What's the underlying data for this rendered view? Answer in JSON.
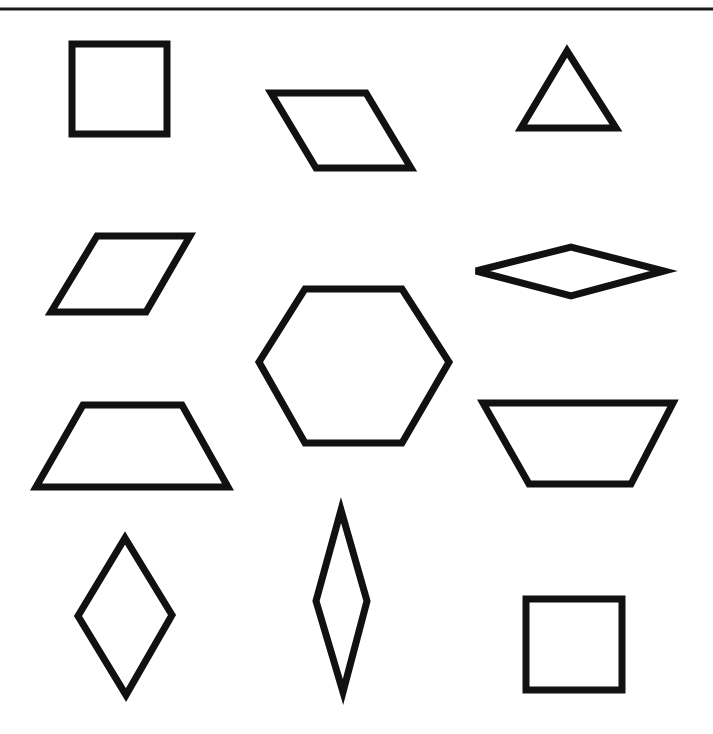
{
  "diagram": {
    "stroke_color": "#111111",
    "background": "#ffffff",
    "top_rule": {
      "x1": 0,
      "y1": 9,
      "x2": 713,
      "y2": 9
    },
    "shapes": [
      {
        "name": "square-top-left",
        "type": "square",
        "points": "72,44 167,44 167,134 72,134"
      },
      {
        "name": "rhombus-tilted-top",
        "type": "rhombus",
        "points": "271,93 366,93 411,168 316,168"
      },
      {
        "name": "triangle-top-right",
        "type": "triangle",
        "points": "567,51 616,128 521,128"
      },
      {
        "name": "rhombus-left",
        "type": "rhombus",
        "points": "97,236 190,236 146,312 51,312"
      },
      {
        "name": "thin-rhombus-horizontal",
        "type": "rhombus",
        "points": "476,271 571,247 664,271 571,296"
      },
      {
        "name": "hexagon-center",
        "type": "hexagon",
        "points": "305,289 402,289 449,362 402,443 305,443 259,362"
      },
      {
        "name": "trapezoid-left",
        "type": "trapezoid",
        "points": "83,405 182,405 228,487 36,487"
      },
      {
        "name": "trapezoid-right-inverted",
        "type": "trapezoid",
        "points": "483,403 673,403 631,484 529,484"
      },
      {
        "name": "rhombus-vertical-left",
        "type": "rhombus",
        "points": "125,538 172,615 126,695 78,616"
      },
      {
        "name": "thin-rhombus-vertical",
        "type": "rhombus",
        "points": "341,510 367,601 343,692 316,601"
      },
      {
        "name": "square-bottom-right",
        "type": "square",
        "points": "526,599 622,599 622,690 526,690"
      }
    ]
  }
}
